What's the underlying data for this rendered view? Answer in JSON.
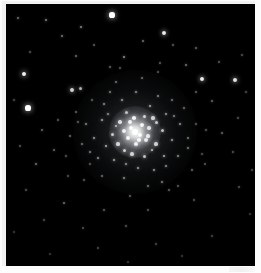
{
  "image": {
    "subject": "globular-star-cluster",
    "caption": "",
    "width": 261,
    "height": 273,
    "frame_color": "#f2f2f2",
    "sky_color": "#000000",
    "star_color": "#ffffff",
    "page_background": "#fdfdfd"
  },
  "field": {
    "left": 4,
    "top": 3,
    "width": 249,
    "height": 262
  },
  "cluster": {
    "name": "globular-cluster",
    "center_x": 129,
    "center_y": 128,
    "core_radius": 13,
    "halo_radius": 62,
    "core_peak_color": "#ffffff",
    "halo_glow_color": "rgba(200,205,215,0.10)"
  },
  "core_bloom": {
    "center_x": 129,
    "center_y": 128,
    "radius": 26
  },
  "artifact": {
    "name": "corner-smudge",
    "visible": true
  },
  "chart_data": {
    "type": "scatter",
    "title": "",
    "xlabel": "",
    "ylabel": "",
    "xlim": [
      0,
      249
    ],
    "ylim": [
      0,
      262
    ],
    "grid": false,
    "legend": null,
    "note": "star field: x,y are pixel positions within the black sky field; r is drawn radius in px; b is relative brightness 0-1",
    "field_stars": [
      {
        "x": 106,
        "y": 11,
        "r": 2.6,
        "b": 1.0
      },
      {
        "x": 158,
        "y": 29,
        "r": 2.1,
        "b": 0.92
      },
      {
        "x": 18,
        "y": 70,
        "r": 2.3,
        "b": 0.95
      },
      {
        "x": 22,
        "y": 104,
        "r": 2.6,
        "b": 1.0
      },
      {
        "x": 196,
        "y": 75,
        "r": 2.2,
        "b": 0.93
      },
      {
        "x": 229,
        "y": 76,
        "r": 2.1,
        "b": 0.9
      },
      {
        "x": 66,
        "y": 86,
        "r": 1.9,
        "b": 0.82
      },
      {
        "x": 74,
        "y": 84,
        "r": 1.5,
        "b": 0.7
      },
      {
        "x": 118,
        "y": 53,
        "r": 1.3,
        "b": 0.58
      },
      {
        "x": 75,
        "y": 23,
        "r": 1.2,
        "b": 0.54
      },
      {
        "x": 56,
        "y": 32,
        "r": 1.1,
        "b": 0.48
      },
      {
        "x": 40,
        "y": 16,
        "r": 1.2,
        "b": 0.52
      },
      {
        "x": 12,
        "y": 14,
        "r": 1.1,
        "b": 0.46
      },
      {
        "x": 70,
        "y": 52,
        "r": 1.0,
        "b": 0.42
      },
      {
        "x": 88,
        "y": 41,
        "r": 0.9,
        "b": 0.36
      },
      {
        "x": 104,
        "y": 63,
        "r": 1.0,
        "b": 0.4
      },
      {
        "x": 137,
        "y": 37,
        "r": 1.0,
        "b": 0.44
      },
      {
        "x": 167,
        "y": 41,
        "r": 0.9,
        "b": 0.36
      },
      {
        "x": 190,
        "y": 44,
        "r": 1.0,
        "b": 0.4
      },
      {
        "x": 213,
        "y": 58,
        "r": 0.9,
        "b": 0.35
      },
      {
        "x": 236,
        "y": 51,
        "r": 0.8,
        "b": 0.3
      },
      {
        "x": 180,
        "y": 61,
        "r": 1.1,
        "b": 0.47
      },
      {
        "x": 154,
        "y": 59,
        "r": 0.9,
        "b": 0.37
      },
      {
        "x": 206,
        "y": 97,
        "r": 1.0,
        "b": 0.41
      },
      {
        "x": 232,
        "y": 114,
        "r": 0.9,
        "b": 0.34
      },
      {
        "x": 240,
        "y": 88,
        "r": 0.8,
        "b": 0.29
      },
      {
        "x": 216,
        "y": 129,
        "r": 1.0,
        "b": 0.4
      },
      {
        "x": 227,
        "y": 148,
        "r": 0.9,
        "b": 0.33
      },
      {
        "x": 199,
        "y": 160,
        "r": 0.9,
        "b": 0.35
      },
      {
        "x": 233,
        "y": 183,
        "r": 0.9,
        "b": 0.32
      },
      {
        "x": 246,
        "y": 166,
        "r": 0.8,
        "b": 0.28
      },
      {
        "x": 188,
        "y": 196,
        "r": 0.9,
        "b": 0.33
      },
      {
        "x": 163,
        "y": 186,
        "r": 1.0,
        "b": 0.38
      },
      {
        "x": 142,
        "y": 206,
        "r": 0.9,
        "b": 0.34
      },
      {
        "x": 120,
        "y": 222,
        "r": 0.9,
        "b": 0.33
      },
      {
        "x": 98,
        "y": 206,
        "r": 1.0,
        "b": 0.38
      },
      {
        "x": 77,
        "y": 224,
        "r": 0.9,
        "b": 0.32
      },
      {
        "x": 58,
        "y": 199,
        "r": 1.1,
        "b": 0.45
      },
      {
        "x": 38,
        "y": 216,
        "r": 0.8,
        "b": 0.28
      },
      {
        "x": 20,
        "y": 186,
        "r": 0.9,
        "b": 0.33
      },
      {
        "x": 30,
        "y": 160,
        "r": 1.1,
        "b": 0.46
      },
      {
        "x": 14,
        "y": 142,
        "r": 0.9,
        "b": 0.34
      },
      {
        "x": 48,
        "y": 146,
        "r": 1.0,
        "b": 0.4
      },
      {
        "x": 62,
        "y": 172,
        "r": 0.9,
        "b": 0.33
      },
      {
        "x": 84,
        "y": 160,
        "r": 0.9,
        "b": 0.35
      },
      {
        "x": 36,
        "y": 126,
        "r": 1.0,
        "b": 0.4
      },
      {
        "x": 52,
        "y": 116,
        "r": 0.9,
        "b": 0.36
      },
      {
        "x": 24,
        "y": 48,
        "r": 0.9,
        "b": 0.34
      },
      {
        "x": 8,
        "y": 96,
        "r": 0.8,
        "b": 0.28
      },
      {
        "x": 92,
        "y": 244,
        "r": 0.8,
        "b": 0.27
      },
      {
        "x": 150,
        "y": 240,
        "r": 0.8,
        "b": 0.27
      },
      {
        "x": 206,
        "y": 232,
        "r": 0.8,
        "b": 0.26
      },
      {
        "x": 176,
        "y": 252,
        "r": 0.7,
        "b": 0.22
      },
      {
        "x": 122,
        "y": 258,
        "r": 0.7,
        "b": 0.22
      },
      {
        "x": 44,
        "y": 250,
        "r": 0.7,
        "b": 0.22
      },
      {
        "x": 244,
        "y": 210,
        "r": 0.7,
        "b": 0.23
      },
      {
        "x": 8,
        "y": 228,
        "r": 0.7,
        "b": 0.22
      },
      {
        "x": 168,
        "y": 112,
        "r": 1.2,
        "b": 0.52
      },
      {
        "x": 182,
        "y": 134,
        "r": 1.1,
        "b": 0.47
      },
      {
        "x": 190,
        "y": 120,
        "r": 0.9,
        "b": 0.36
      },
      {
        "x": 64,
        "y": 132,
        "r": 1.0,
        "b": 0.42
      },
      {
        "x": 72,
        "y": 118,
        "r": 0.9,
        "b": 0.37
      }
    ],
    "cluster_stars": [
      {
        "x": 129,
        "y": 128,
        "r": 3.0,
        "b": 1.0
      },
      {
        "x": 125,
        "y": 124,
        "r": 2.4,
        "b": 0.98
      },
      {
        "x": 134,
        "y": 131,
        "r": 2.3,
        "b": 0.97
      },
      {
        "x": 122,
        "y": 134,
        "r": 2.1,
        "b": 0.94
      },
      {
        "x": 136,
        "y": 121,
        "r": 2.0,
        "b": 0.93
      },
      {
        "x": 118,
        "y": 127,
        "r": 1.9,
        "b": 0.9
      },
      {
        "x": 140,
        "y": 136,
        "r": 1.9,
        "b": 0.89
      },
      {
        "x": 130,
        "y": 140,
        "r": 1.8,
        "b": 0.88
      },
      {
        "x": 143,
        "y": 124,
        "r": 1.7,
        "b": 0.84
      },
      {
        "x": 114,
        "y": 118,
        "r": 1.7,
        "b": 0.83
      },
      {
        "x": 112,
        "y": 140,
        "r": 1.6,
        "b": 0.8
      },
      {
        "x": 147,
        "y": 114,
        "r": 1.6,
        "b": 0.79
      },
      {
        "x": 150,
        "y": 140,
        "r": 1.6,
        "b": 0.78
      },
      {
        "x": 126,
        "y": 150,
        "r": 1.6,
        "b": 0.78
      },
      {
        "x": 106,
        "y": 130,
        "r": 1.5,
        "b": 0.75
      },
      {
        "x": 138,
        "y": 152,
        "r": 1.5,
        "b": 0.74
      },
      {
        "x": 156,
        "y": 126,
        "r": 1.5,
        "b": 0.73
      },
      {
        "x": 120,
        "y": 108,
        "r": 1.5,
        "b": 0.73
      },
      {
        "x": 100,
        "y": 142,
        "r": 1.4,
        "b": 0.7
      },
      {
        "x": 158,
        "y": 152,
        "r": 1.4,
        "b": 0.69
      },
      {
        "x": 144,
        "y": 102,
        "r": 1.4,
        "b": 0.68
      },
      {
        "x": 108,
        "y": 156,
        "r": 1.4,
        "b": 0.68
      },
      {
        "x": 96,
        "y": 116,
        "r": 1.4,
        "b": 0.67
      },
      {
        "x": 166,
        "y": 136,
        "r": 1.3,
        "b": 0.64
      },
      {
        "x": 132,
        "y": 164,
        "r": 1.3,
        "b": 0.64
      },
      {
        "x": 88,
        "y": 134,
        "r": 1.3,
        "b": 0.63
      },
      {
        "x": 160,
        "y": 110,
        "r": 1.3,
        "b": 0.62
      },
      {
        "x": 116,
        "y": 96,
        "r": 1.3,
        "b": 0.62
      },
      {
        "x": 148,
        "y": 166,
        "r": 1.3,
        "b": 0.61
      },
      {
        "x": 92,
        "y": 154,
        "r": 1.2,
        "b": 0.58
      },
      {
        "x": 174,
        "y": 120,
        "r": 1.2,
        "b": 0.57
      },
      {
        "x": 130,
        "y": 88,
        "r": 1.2,
        "b": 0.57
      },
      {
        "x": 98,
        "y": 100,
        "r": 1.2,
        "b": 0.56
      },
      {
        "x": 172,
        "y": 152,
        "r": 1.2,
        "b": 0.55
      },
      {
        "x": 118,
        "y": 174,
        "r": 1.2,
        "b": 0.55
      },
      {
        "x": 80,
        "y": 120,
        "r": 1.1,
        "b": 0.52
      },
      {
        "x": 152,
        "y": 92,
        "r": 1.1,
        "b": 0.52
      },
      {
        "x": 156,
        "y": 178,
        "r": 1.1,
        "b": 0.5
      },
      {
        "x": 84,
        "y": 148,
        "r": 1.1,
        "b": 0.5
      },
      {
        "x": 104,
        "y": 88,
        "r": 1.1,
        "b": 0.49
      },
      {
        "x": 182,
        "y": 144,
        "r": 1.1,
        "b": 0.48
      },
      {
        "x": 142,
        "y": 182,
        "r": 1.0,
        "b": 0.46
      },
      {
        "x": 76,
        "y": 140,
        "r": 1.0,
        "b": 0.45
      },
      {
        "x": 166,
        "y": 96,
        "r": 1.0,
        "b": 0.45
      },
      {
        "x": 110,
        "y": 78,
        "r": 1.0,
        "b": 0.44
      },
      {
        "x": 178,
        "y": 104,
        "r": 1.0,
        "b": 0.43
      },
      {
        "x": 96,
        "y": 172,
        "r": 1.0,
        "b": 0.43
      },
      {
        "x": 136,
        "y": 74,
        "r": 1.0,
        "b": 0.42
      },
      {
        "x": 186,
        "y": 166,
        "r": 0.9,
        "b": 0.4
      },
      {
        "x": 70,
        "y": 108,
        "r": 0.9,
        "b": 0.39
      },
      {
        "x": 124,
        "y": 192,
        "r": 0.9,
        "b": 0.38
      },
      {
        "x": 190,
        "y": 88,
        "r": 0.9,
        "b": 0.37
      },
      {
        "x": 86,
        "y": 96,
        "r": 0.9,
        "b": 0.37
      },
      {
        "x": 172,
        "y": 182,
        "r": 0.9,
        "b": 0.36
      },
      {
        "x": 60,
        "y": 152,
        "r": 0.9,
        "b": 0.35
      },
      {
        "x": 152,
        "y": 68,
        "r": 0.9,
        "b": 0.35
      },
      {
        "x": 200,
        "y": 126,
        "r": 0.8,
        "b": 0.33
      },
      {
        "x": 78,
        "y": 176,
        "r": 0.8,
        "b": 0.32
      },
      {
        "x": 114,
        "y": 64,
        "r": 0.8,
        "b": 0.32
      },
      {
        "x": 196,
        "y": 150,
        "r": 0.8,
        "b": 0.31
      },
      {
        "x": 128,
        "y": 114,
        "r": 1.8,
        "b": 0.92
      },
      {
        "x": 138,
        "y": 112,
        "r": 1.5,
        "b": 0.8
      },
      {
        "x": 118,
        "y": 146,
        "r": 1.5,
        "b": 0.79
      },
      {
        "x": 146,
        "y": 146,
        "r": 1.4,
        "b": 0.76
      },
      {
        "x": 110,
        "y": 122,
        "r": 1.4,
        "b": 0.74
      },
      {
        "x": 142,
        "y": 132,
        "r": 1.6,
        "b": 0.85
      },
      {
        "x": 124,
        "y": 118,
        "r": 1.9,
        "b": 0.93
      },
      {
        "x": 133,
        "y": 136,
        "r": 1.8,
        "b": 0.9
      },
      {
        "x": 120,
        "y": 160,
        "r": 1.2,
        "b": 0.58
      },
      {
        "x": 160,
        "y": 162,
        "r": 1.2,
        "b": 0.56
      },
      {
        "x": 102,
        "y": 110,
        "r": 1.2,
        "b": 0.57
      },
      {
        "x": 150,
        "y": 118,
        "r": 1.5,
        "b": 0.77
      }
    ]
  }
}
